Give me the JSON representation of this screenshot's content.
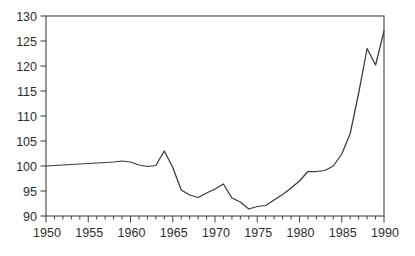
{
  "chart_data": {
    "type": "line",
    "title": "",
    "xlabel": "",
    "ylabel": "",
    "xlim": [
      1950,
      1990
    ],
    "ylim": [
      90,
      130
    ],
    "grid": false,
    "legend": "none",
    "frame": "full-box",
    "x_major_ticks": [
      1950,
      1955,
      1960,
      1965,
      1970,
      1975,
      1980,
      1985,
      1990
    ],
    "x_minor_tick_interval": 1,
    "y_ticks": [
      90,
      95,
      100,
      105,
      110,
      115,
      120,
      125,
      130
    ],
    "line_color": "#3a3a3a",
    "axis_color": "#444444",
    "background_color": "#ffffff",
    "x": [
      1950,
      1951,
      1952,
      1953,
      1954,
      1955,
      1956,
      1957,
      1958,
      1959,
      1960,
      1961,
      1962,
      1963,
      1964,
      1965,
      1966,
      1967,
      1968,
      1969,
      1970,
      1971,
      1972,
      1973,
      1974,
      1975,
      1976,
      1977,
      1978,
      1979,
      1980,
      1981,
      1982,
      1983,
      1984,
      1985,
      1986,
      1987,
      1988,
      1989,
      1990
    ],
    "values": [
      100.0,
      100.1,
      100.2,
      100.3,
      100.4,
      100.5,
      100.6,
      100.7,
      100.8,
      101.0,
      100.8,
      100.2,
      99.9,
      100.1,
      103.0,
      99.7,
      95.2,
      94.2,
      93.7,
      94.6,
      95.4,
      96.4,
      93.6,
      92.8,
      91.4,
      91.9,
      92.1,
      93.2,
      94.3,
      95.6,
      97.0,
      98.9,
      98.9,
      99.1,
      100.0,
      102.4,
      106.5,
      114.5,
      123.5,
      120.2,
      127.0
    ]
  }
}
